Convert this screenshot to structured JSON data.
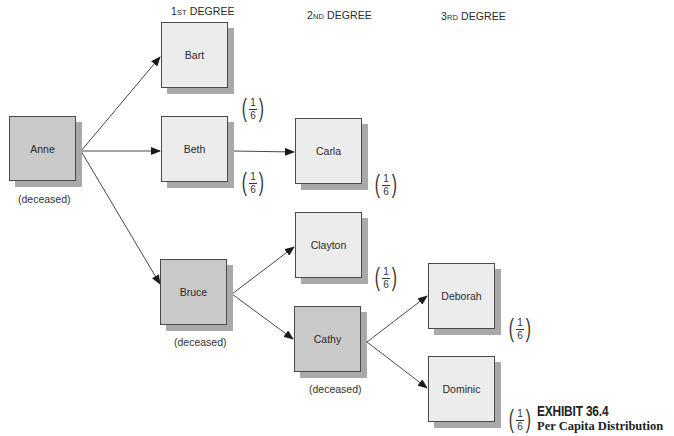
{
  "headers": [
    {
      "num": "1",
      "suffix": "ST",
      "label": "DEGREE"
    },
    {
      "num": "2",
      "suffix": "ND",
      "label": "DEGREE"
    },
    {
      "num": "3",
      "suffix": "RD",
      "label": "DEGREE"
    }
  ],
  "nodes": {
    "anne": {
      "name": "Anne",
      "status": "(deceased)"
    },
    "bart": {
      "name": "Bart",
      "share": {
        "num": "1",
        "den": "6"
      }
    },
    "beth": {
      "name": "Beth",
      "share": {
        "num": "1",
        "den": "6"
      }
    },
    "bruce": {
      "name": "Bruce",
      "status": "(deceased)"
    },
    "carla": {
      "name": "Carla",
      "share": {
        "num": "1",
        "den": "6"
      }
    },
    "clayton": {
      "name": "Clayton",
      "share": {
        "num": "1",
        "den": "6"
      }
    },
    "cathy": {
      "name": "Cathy",
      "status": "(deceased)"
    },
    "deborah": {
      "name": "Deborah",
      "share": {
        "num": "1",
        "den": "6"
      }
    },
    "dominic": {
      "name": "Dominic",
      "share": {
        "num": "1",
        "den": "6"
      }
    }
  },
  "edges": [
    [
      "Anne",
      "Bart"
    ],
    [
      "Anne",
      "Beth"
    ],
    [
      "Anne",
      "Bruce"
    ],
    [
      "Beth",
      "Carla"
    ],
    [
      "Bruce",
      "Clayton"
    ],
    [
      "Bruce",
      "Cathy"
    ],
    [
      "Cathy",
      "Deborah"
    ],
    [
      "Cathy",
      "Dominic"
    ]
  ],
  "colors": {
    "living_fill": "#ececec",
    "deceased_fill": "#c9c9c9",
    "shadow": "#a9a9a9",
    "border": "#4a4a4a"
  },
  "caption": {
    "title": "EXHIBIT 36.4",
    "subtitle": "Per Capita Distribution"
  }
}
